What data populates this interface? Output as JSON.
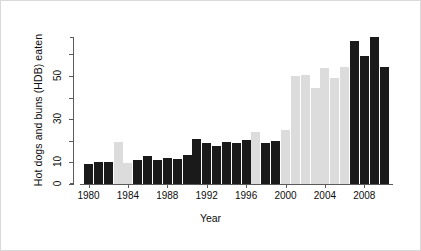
{
  "chart_data": {
    "type": "bar",
    "title": "",
    "subtitle": "",
    "xlabel": "Year",
    "ylabel": "Hot dogs and buns (HDB) eaten",
    "xlim": [
      1979.4,
      2011.6
    ],
    "ylim": [
      0,
      68
    ],
    "grid": false,
    "legend": null,
    "y_ticks": [
      0,
      10,
      20,
      30,
      40,
      50,
      60
    ],
    "y_tick_labels": [
      "0",
      "10",
      "",
      "30",
      "",
      "50",
      ""
    ],
    "x_tick_values": [
      1980,
      1984,
      1988,
      1992,
      1996,
      2000,
      2004,
      2008
    ],
    "x_tick_labels": [
      "1980",
      "1984",
      "1988",
      "1992",
      "1996",
      "2000",
      "2004",
      "2008"
    ],
    "categories": [
      "1980",
      "1981",
      "1982",
      "1983",
      "1984",
      "1985",
      "1986",
      "1987",
      "1988",
      "1989",
      "1990",
      "1991",
      "1992",
      "1993",
      "1994",
      "1995",
      "1996",
      "1997",
      "1998",
      "1999",
      "2000",
      "2001",
      "2002",
      "2003",
      "2004",
      "2005",
      "2006",
      "2007",
      "2008",
      "2009",
      "2010"
    ],
    "values": [
      9.1,
      10.3,
      10.3,
      19.5,
      9.5,
      11.0,
      13.0,
      11.0,
      12.0,
      11.5,
      13.5,
      21.0,
      19.0,
      17.5,
      19.5,
      19.0,
      20.5,
      24.0,
      19.0,
      20.0,
      25.0,
      50.0,
      50.5,
      44.5,
      53.5,
      49.0,
      54.0,
      66.0,
      59.0,
      68.0,
      54.0
    ],
    "bar_colors": [
      "dark",
      "dark",
      "dark",
      "light",
      "light",
      "dark",
      "dark",
      "dark",
      "dark",
      "dark",
      "dark",
      "dark",
      "dark",
      "dark",
      "dark",
      "dark",
      "dark",
      "light",
      "dark",
      "dark",
      "light",
      "light",
      "light",
      "light",
      "light",
      "light",
      "light",
      "dark",
      "dark",
      "dark",
      "dark"
    ],
    "colors": {
      "dark": "#1a1a1a",
      "light": "#dcdcdc",
      "axis": "#5a5a5a",
      "text": "#0d0d0d",
      "background": "#ffffff"
    }
  }
}
